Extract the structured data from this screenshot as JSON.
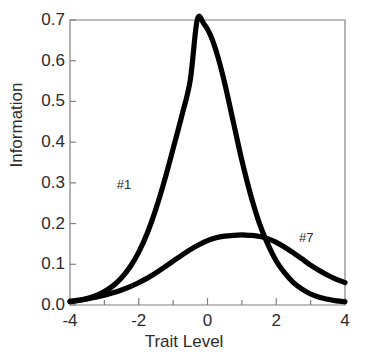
{
  "chart_data": {
    "type": "line",
    "title": "",
    "xlabel": "Trait Level",
    "ylabel": "Information",
    "xlim": [
      -4,
      4
    ],
    "ylim": [
      0.0,
      0.7
    ],
    "grid": false,
    "legend_position": "inline-annotation",
    "line_color": "#000000",
    "axis_color": "#808080",
    "text_color": "#2b2b2b",
    "xticks": [
      {
        "value": -4,
        "label": "-4",
        "major": true
      },
      {
        "value": -3,
        "label": "",
        "major": false
      },
      {
        "value": -2,
        "label": "-2",
        "major": true
      },
      {
        "value": -1,
        "label": "",
        "major": false
      },
      {
        "value": 0,
        "label": "0",
        "major": true
      },
      {
        "value": 1,
        "label": "",
        "major": false
      },
      {
        "value": 2,
        "label": "2",
        "major": true
      },
      {
        "value": 3,
        "label": "",
        "major": false
      },
      {
        "value": 4,
        "label": "4",
        "major": true
      }
    ],
    "yticks": [
      {
        "value": 0.0,
        "label": "0.0"
      },
      {
        "value": 0.1,
        "label": "0.1"
      },
      {
        "value": 0.2,
        "label": "0.2"
      },
      {
        "value": 0.3,
        "label": "0.3"
      },
      {
        "value": 0.4,
        "label": "0.4"
      },
      {
        "value": 0.5,
        "label": "0.5"
      },
      {
        "value": 0.6,
        "label": "0.6"
      },
      {
        "value": 0.7,
        "label": "0.7"
      }
    ],
    "series": [
      {
        "name": "#1",
        "label": "#1",
        "annotation_x": -2.35,
        "annotation_y": 0.295,
        "peak": {
          "x": -0.3,
          "y": 0.7
        },
        "x": [
          -4.0,
          -3.75,
          -3.5,
          -3.25,
          -3.0,
          -2.75,
          -2.5,
          -2.25,
          -2.0,
          -1.75,
          -1.5,
          -1.25,
          -1.0,
          -0.75,
          -0.5,
          -0.3,
          -0.1,
          0.1,
          0.3,
          0.5,
          0.75,
          1.0,
          1.25,
          1.5,
          1.75,
          2.0,
          2.25,
          2.5,
          2.75,
          3.0,
          3.25,
          3.5,
          3.75,
          4.0
        ],
        "y": [
          0.008,
          0.011,
          0.016,
          0.023,
          0.033,
          0.047,
          0.067,
          0.094,
          0.13,
          0.177,
          0.236,
          0.306,
          0.384,
          0.464,
          0.553,
          0.7,
          0.69,
          0.66,
          0.61,
          0.545,
          0.45,
          0.355,
          0.272,
          0.203,
          0.15,
          0.108,
          0.078,
          0.055,
          0.039,
          0.027,
          0.019,
          0.014,
          0.01,
          0.008
        ]
      },
      {
        "name": "#7",
        "label": "#7",
        "annotation_x": 2.95,
        "annotation_y": 0.165,
        "peak": {
          "x": 1.4,
          "y": 0.17
        },
        "x": [
          -4.0,
          -3.75,
          -3.5,
          -3.25,
          -3.0,
          -2.75,
          -2.5,
          -2.25,
          -2.0,
          -1.75,
          -1.5,
          -1.25,
          -1.0,
          -0.75,
          -0.5,
          -0.25,
          0.0,
          0.25,
          0.5,
          0.75,
          1.0,
          1.25,
          1.4,
          1.6,
          1.8,
          2.0,
          2.25,
          2.5,
          2.75,
          3.0,
          3.25,
          3.5,
          3.75,
          4.0
        ],
        "y": [
          0.009,
          0.012,
          0.015,
          0.019,
          0.024,
          0.03,
          0.037,
          0.045,
          0.055,
          0.066,
          0.079,
          0.093,
          0.108,
          0.122,
          0.136,
          0.148,
          0.158,
          0.165,
          0.169,
          0.171,
          0.172,
          0.171,
          0.17,
          0.167,
          0.161,
          0.154,
          0.142,
          0.128,
          0.113,
          0.098,
          0.085,
          0.073,
          0.063,
          0.055
        ]
      }
    ]
  },
  "axis_titles": {
    "x": "Trait Level",
    "y": "Information"
  }
}
